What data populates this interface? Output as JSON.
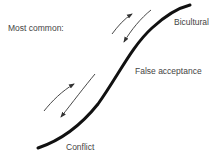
{
  "diagram": {
    "heading": "Most common:",
    "curve_labels": {
      "top": "Bicultural",
      "middle": "False acceptance",
      "bottom": "Conflict"
    },
    "arrows": [
      {
        "name": "upper-forward-arrow",
        "direction": "up-right"
      },
      {
        "name": "upper-backward-arrow",
        "direction": "down-left"
      },
      {
        "name": "lower-forward-arrow",
        "direction": "up-right"
      },
      {
        "name": "lower-backward-arrow",
        "direction": "down-left"
      }
    ],
    "colors": {
      "curve": "#111111",
      "arrow": "#333333",
      "text": "#444444",
      "background": "#ffffff"
    }
  }
}
